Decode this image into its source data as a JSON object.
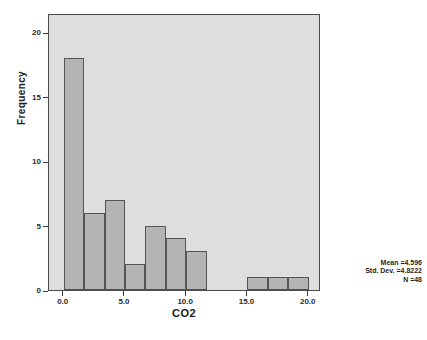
{
  "chart_data": {
    "type": "bar",
    "chart_style": "histogram",
    "title": "",
    "xlabel": "CO2",
    "ylabel": "Frequency",
    "xlim": [
      -1.2,
      21.0
    ],
    "ylim": [
      0,
      21.5
    ],
    "grid": false,
    "legend": "none",
    "x_tick_labels": [
      "0.0",
      "5.0",
      "10.0",
      "15.0",
      "20.0"
    ],
    "x_tick_values": [
      0,
      5,
      10,
      15,
      20
    ],
    "y_tick_labels": [
      "0",
      "5",
      "10",
      "15",
      "20"
    ],
    "y_tick_values": [
      0,
      5,
      10,
      15,
      20
    ],
    "bin_width": 1.667,
    "bins": [
      {
        "x_start": 0.0,
        "x_end": 1.667,
        "frequency": 18
      },
      {
        "x_start": 1.667,
        "x_end": 3.333,
        "frequency": 6
      },
      {
        "x_start": 3.333,
        "x_end": 5.0,
        "frequency": 7
      },
      {
        "x_start": 5.0,
        "x_end": 6.667,
        "frequency": 2
      },
      {
        "x_start": 6.667,
        "x_end": 8.333,
        "frequency": 5
      },
      {
        "x_start": 8.333,
        "x_end": 10.0,
        "frequency": 4
      },
      {
        "x_start": 10.0,
        "x_end": 11.667,
        "frequency": 3
      },
      {
        "x_start": 15.0,
        "x_end": 16.667,
        "frequency": 1
      },
      {
        "x_start": 16.667,
        "x_end": 18.333,
        "frequency": 1
      },
      {
        "x_start": 18.333,
        "x_end": 20.0,
        "frequency": 1
      }
    ],
    "categories": [
      "0.0-1.7",
      "1.7-3.3",
      "3.3-5.0",
      "5.0-6.7",
      "6.7-8.3",
      "8.3-10.0",
      "10.0-11.7",
      "15.0-16.7",
      "16.7-18.3",
      "18.3-20.0"
    ],
    "values": [
      18,
      6,
      7,
      2,
      5,
      4,
      3,
      1,
      1,
      1
    ],
    "annotations": {
      "mean": "Mean =4.596",
      "std_dev": "Std. Dev. =4.8222",
      "n": "N =48"
    },
    "colors": {
      "bar_fill": "#b4b4b4",
      "bar_stroke": "#555555",
      "plot_background": "#dedede",
      "plot_border": "#4a4a4a",
      "page_background": "#ffffff",
      "text": "#1a1a1a"
    }
  }
}
